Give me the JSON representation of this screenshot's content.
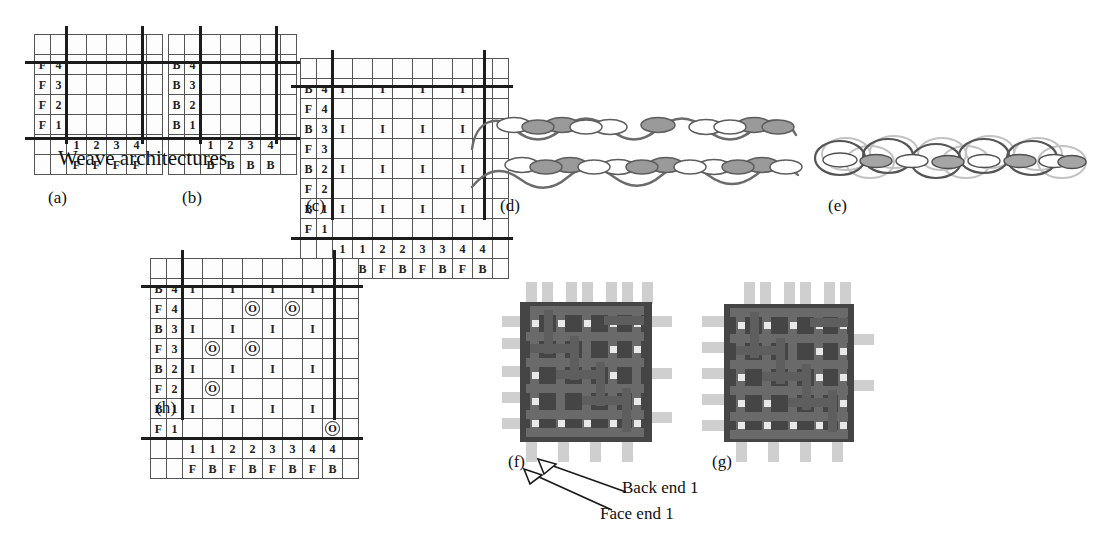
{
  "figure": {
    "title": "Weave architectures",
    "dark_fill": "#6e6e6e",
    "line_color": "#1c1c1c",
    "yarn_color": "#6b6b6b",
    "fabric_color": "#4a4a4a"
  },
  "panels": {
    "a": {
      "caption": "(a)",
      "row_labels": [
        {
          "set": "F",
          "num": "4"
        },
        {
          "set": "F",
          "num": "3"
        },
        {
          "set": "F",
          "num": "2"
        },
        {
          "set": "F",
          "num": "1"
        }
      ],
      "col_nums": [
        "1",
        "2",
        "3",
        "4"
      ],
      "col_sets": [
        "F",
        "F",
        "F",
        "F"
      ],
      "cells": [
        [
          0,
          1,
          1,
          0
        ],
        [
          1,
          1,
          0,
          0
        ],
        [
          1,
          0,
          0,
          1
        ],
        [
          0,
          0,
          1,
          1
        ]
      ]
    },
    "b": {
      "caption": "(b)",
      "row_labels": [
        {
          "set": "B",
          "num": "4"
        },
        {
          "set": "B",
          "num": "3"
        },
        {
          "set": "B",
          "num": "2"
        },
        {
          "set": "B",
          "num": "1"
        }
      ],
      "col_nums": [
        "1",
        "2",
        "3",
        "4"
      ],
      "col_sets": [
        "B",
        "B",
        "B",
        "B"
      ],
      "cells": [
        [
          0,
          1,
          1,
          0
        ],
        [
          1,
          1,
          0,
          0
        ],
        [
          1,
          0,
          0,
          1
        ],
        [
          0,
          0,
          1,
          1
        ]
      ]
    },
    "c": {
      "caption": "(c)",
      "row_labels": [
        {
          "set": "B",
          "num": "4"
        },
        {
          "set": "F",
          "num": "4"
        },
        {
          "set": "B",
          "num": "3"
        },
        {
          "set": "F",
          "num": "3"
        },
        {
          "set": "B",
          "num": "2"
        },
        {
          "set": "F",
          "num": "2"
        },
        {
          "set": "B",
          "num": "1"
        },
        {
          "set": "F",
          "num": "1"
        }
      ],
      "col_nums": [
        "1",
        "1",
        "2",
        "2",
        "3",
        "3",
        "4",
        "4"
      ],
      "col_sets": [
        "F",
        "B",
        "F",
        "B",
        "F",
        "B",
        "F",
        "B"
      ],
      "cells": [
        [
          "I",
          "",
          "I",
          "f",
          "I",
          "f",
          "I",
          ""
        ],
        [
          "",
          "",
          "f",
          "",
          "f",
          "",
          "",
          ""
        ],
        [
          "I",
          "f",
          "I",
          "f",
          "I",
          "",
          "I",
          ""
        ],
        [
          "f",
          "",
          "f",
          "",
          "",
          "",
          "",
          ""
        ],
        [
          "I",
          "f",
          "I",
          "",
          "I",
          "",
          "I",
          "f"
        ],
        [
          "f",
          "",
          "",
          "",
          "",
          "",
          "f",
          ""
        ],
        [
          "I",
          "",
          "I",
          "",
          "I",
          "f",
          "I",
          "f"
        ],
        [
          "",
          "",
          "",
          "",
          "f",
          "",
          "f",
          ""
        ]
      ]
    },
    "h": {
      "caption": "(h)",
      "row_labels": [
        {
          "set": "B",
          "num": "4"
        },
        {
          "set": "F",
          "num": "4"
        },
        {
          "set": "B",
          "num": "3"
        },
        {
          "set": "F",
          "num": "3"
        },
        {
          "set": "B",
          "num": "2"
        },
        {
          "set": "F",
          "num": "2"
        },
        {
          "set": "B",
          "num": "1"
        },
        {
          "set": "F",
          "num": "1"
        }
      ],
      "col_nums": [
        "1",
        "1",
        "2",
        "2",
        "3",
        "3",
        "4",
        "4"
      ],
      "col_sets": [
        "F",
        "B",
        "F",
        "B",
        "F",
        "B",
        "F",
        "B"
      ],
      "cells": [
        [
          "I",
          "",
          "I",
          "f",
          "I",
          "f",
          "I",
          ""
        ],
        [
          "",
          "",
          "f",
          "O",
          "f",
          "O",
          "",
          ""
        ],
        [
          "I",
          "f",
          "I",
          "f",
          "I",
          "",
          "I",
          ""
        ],
        [
          "f",
          "O",
          "f",
          "O",
          "",
          "",
          "",
          ""
        ],
        [
          "I",
          "f",
          "I",
          "",
          "I",
          "",
          "I",
          "f"
        ],
        [
          "f",
          "O",
          "",
          "",
          "",
          "",
          "f",
          ""
        ],
        [
          "I",
          "",
          "I",
          "",
          "I",
          "f",
          "I",
          "f"
        ],
        [
          "",
          "",
          "",
          "",
          "f",
          "",
          "f",
          "O"
        ]
      ]
    },
    "d": {
      "caption": "(d)"
    },
    "e": {
      "caption": "(e)"
    },
    "f": {
      "caption": "(f)"
    },
    "g": {
      "caption": "(g)"
    }
  },
  "annotations": {
    "back_end": "Back end 1",
    "face_end": "Face end 1"
  }
}
